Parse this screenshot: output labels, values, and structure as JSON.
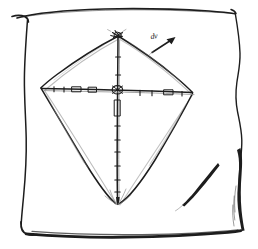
{
  "drawing": {
    "title": "Hand-drawn kite sketch",
    "medium": "pencil on paper",
    "ink_color": "#1d1d1d",
    "faint_ink_color": "#8e8e8e",
    "paper_color": "#ffffff",
    "canvas": {
      "width": 258,
      "height": 249
    }
  },
  "paper": {
    "name": "sheet-of-paper",
    "edges": {
      "top_label": "top-edge",
      "right_label": "right-edge",
      "bottom_label": "bottom-edge",
      "left_label": "left-edge"
    }
  },
  "kite": {
    "name": "diamond-kite",
    "vertices": {
      "top": {
        "label": "top-apex",
        "x": 118,
        "y": 36
      },
      "left": {
        "label": "left-tip",
        "x": 41,
        "y": 88
      },
      "right": {
        "label": "right-tip",
        "x": 192,
        "y": 93
      },
      "bottom": {
        "label": "bottom-apex",
        "x": 118,
        "y": 203
      }
    },
    "spars": {
      "vertical": {
        "label": "vertical-spar",
        "from": "top-apex",
        "to": "bottom-apex"
      },
      "horizontal": {
        "label": "horizontal-spar",
        "from": "left-tip",
        "to": "right-tip"
      }
    },
    "joint": {
      "label": "center-joint",
      "x": 117,
      "y": 90
    },
    "knot": {
      "label": "apex-knot",
      "x": 118,
      "y": 36
    }
  },
  "annotation": {
    "arrow": {
      "name": "direction-arrow",
      "from": {
        "x": 152,
        "y": 52
      },
      "to": {
        "x": 175,
        "y": 38
      }
    },
    "arrow_label": "dv"
  },
  "marks": {
    "crease": {
      "label": "crease-stroke",
      "x": 185,
      "y": 200
    }
  }
}
